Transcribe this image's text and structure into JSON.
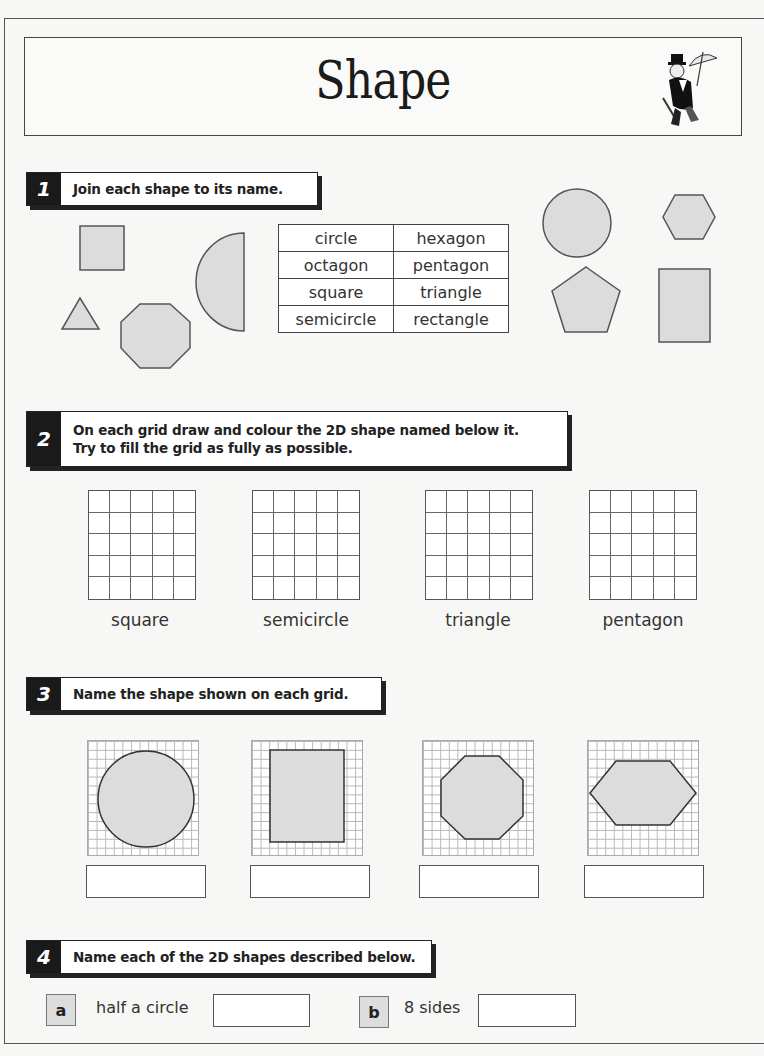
{
  "header": {
    "title": "Shape",
    "mascot_icon": "umbrella-gentleman-icon"
  },
  "q1": {
    "number": "1",
    "instruction": "Join each shape to its name.",
    "shapes_left": [
      "square",
      "triangle",
      "octagon",
      "semicircle"
    ],
    "shapes_right": [
      "circle",
      "hexagon",
      "pentagon",
      "rectangle"
    ],
    "names_table": [
      [
        "circle",
        "hexagon"
      ],
      [
        "octagon",
        "pentagon"
      ],
      [
        "square",
        "triangle"
      ],
      [
        "semicircle",
        "rectangle"
      ]
    ]
  },
  "q2": {
    "number": "2",
    "instruction_line1": "On each grid draw and colour the 2D shape named below it.",
    "instruction_line2": "Try to fill the grid as fully as possible.",
    "grids": [
      {
        "label": "square"
      },
      {
        "label": "semicircle"
      },
      {
        "label": "triangle"
      },
      {
        "label": "pentagon"
      }
    ]
  },
  "q3": {
    "number": "3",
    "instruction": "Name the shape shown on each grid.",
    "grids": [
      {
        "shape": "circle",
        "answer": ""
      },
      {
        "shape": "rectangle",
        "answer": ""
      },
      {
        "shape": "octagon",
        "answer": ""
      },
      {
        "shape": "hexagon",
        "answer": ""
      }
    ]
  },
  "q4": {
    "number": "4",
    "instruction": "Name each of the 2D shapes described below.",
    "items": [
      {
        "letter": "a",
        "description": "half a circle",
        "answer": ""
      },
      {
        "letter": "b",
        "description": "8 sides",
        "answer": ""
      }
    ]
  },
  "colors": {
    "shape_fill": "#dcdcdc",
    "shape_stroke": "#444444",
    "header_dark": "#1a1a1a"
  }
}
